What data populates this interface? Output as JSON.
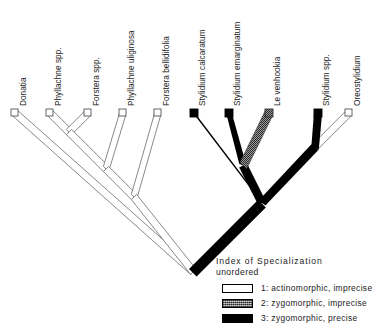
{
  "figure": {
    "type": "phylogenetic-cladogram",
    "taxa": [
      {
        "id": "donatia",
        "label": "Donatia",
        "state": 1,
        "tip_x": 15,
        "tip_y": 113
      },
      {
        "id": "phyllachne-spp",
        "label": "Phyllachne spp.",
        "state": 1,
        "tip_x": 50,
        "tip_y": 113
      },
      {
        "id": "forstera-spp",
        "label": "Forstera spp.",
        "state": 1,
        "tip_x": 88,
        "tip_y": 113
      },
      {
        "id": "phyllachne-uliginosa",
        "label": "Phyllachne uliginosa",
        "state": 1,
        "tip_x": 123,
        "tip_y": 113
      },
      {
        "id": "forstera-bellidifolia",
        "label": "Forstera bellidifolia",
        "state": 1,
        "tip_x": 158,
        "tip_y": 113
      },
      {
        "id": "stylidium-calcaratum",
        "label": "Stylidium calcaratum",
        "state": 3,
        "tip_x": 194,
        "tip_y": 113
      },
      {
        "id": "stylidium-emarginatum",
        "label": "Stylidium emarginatum",
        "state": 3,
        "tip_x": 229,
        "tip_y": 113
      },
      {
        "id": "levenhookia",
        "label": "Le venhookia",
        "state": 2,
        "tip_x": 269,
        "tip_y": 113
      },
      {
        "id": "stylidium-spp",
        "label": "Stylidium spp.",
        "state": 3,
        "tip_x": 318,
        "tip_y": 113
      },
      {
        "id": "oreostylidium",
        "label": "Oreostylidium",
        "state": 1,
        "tip_x": 349,
        "tip_y": 113
      }
    ],
    "label_tops": [
      108,
      108,
      108,
      108,
      108,
      108,
      108,
      108,
      108,
      108
    ]
  },
  "legend": {
    "title": "Index of Specialization",
    "subtitle": "unordered",
    "entries": [
      {
        "swatch": "state1",
        "text": "1:  actinomorphic,  imprecise"
      },
      {
        "swatch": "state2",
        "text": "2:  zygomorphic,  imprecise"
      },
      {
        "swatch": "state3",
        "text": "3:  zygomorphic,  precise"
      }
    ]
  },
  "colors": {
    "state1_fill": "#ffffff",
    "state1_stroke": "#6a6a6a",
    "state2_fill": "#8a8a8a",
    "state3_fill": "#000000",
    "text": "#1b1b1b"
  }
}
